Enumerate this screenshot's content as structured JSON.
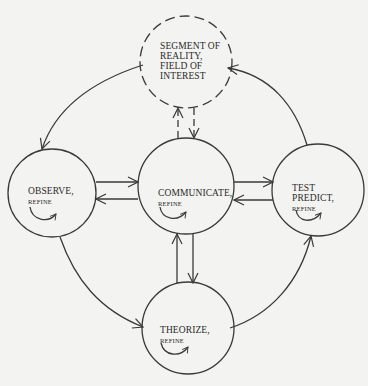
{
  "diagram": {
    "title": "",
    "stroke_color": "#3a3a3a",
    "background": "#f3f3f1",
    "nodes": [
      {
        "id": "segment",
        "lines": [
          "SEGMENT OF",
          "REALITY,",
          "FIELD OF",
          "INTEREST"
        ],
        "sub": "",
        "style": "dashed",
        "center": [
          186,
          62
        ],
        "radius": 46
      },
      {
        "id": "observe",
        "lines": [
          "OBSERVE,"
        ],
        "sub": "REFINE",
        "style": "solid",
        "has_refine_loop": true,
        "center": [
          52,
          193
        ],
        "radius": 44
      },
      {
        "id": "communicate",
        "lines": [
          "COMMUNICATE,"
        ],
        "sub": "REFINE",
        "style": "solid",
        "has_refine_loop": true,
        "center": [
          186,
          186
        ],
        "radius": 48
      },
      {
        "id": "test",
        "lines": [
          "TEST",
          "PREDICT,"
        ],
        "sub": "REFINE",
        "style": "solid",
        "has_refine_loop": true,
        "center": [
          318,
          190
        ],
        "radius": 46
      },
      {
        "id": "theorize",
        "lines": [
          "THEORIZE,"
        ],
        "sub": "REFINE",
        "style": "solid",
        "has_refine_loop": true,
        "center": [
          188,
          328
        ],
        "radius": 46
      }
    ],
    "edges": [
      {
        "from": "segment",
        "to": "observe",
        "type": "curved",
        "style": "solid"
      },
      {
        "from": "observe",
        "to": "theorize",
        "type": "curved",
        "style": "solid"
      },
      {
        "from": "theorize",
        "to": "test",
        "type": "curved",
        "style": "solid"
      },
      {
        "from": "test",
        "to": "segment",
        "type": "curved",
        "style": "solid"
      },
      {
        "from": "observe",
        "to": "communicate",
        "type": "double-line",
        "style": "solid"
      },
      {
        "from": "communicate",
        "to": "observe",
        "type": "double-line",
        "style": "solid"
      },
      {
        "from": "communicate",
        "to": "test",
        "type": "double-line",
        "style": "solid"
      },
      {
        "from": "test",
        "to": "communicate",
        "type": "double-line",
        "style": "solid"
      },
      {
        "from": "communicate",
        "to": "segment",
        "type": "double-line",
        "style": "dashed"
      },
      {
        "from": "segment",
        "to": "communicate",
        "type": "double-line",
        "style": "dashed"
      },
      {
        "from": "theorize",
        "to": "communicate",
        "type": "double-line",
        "style": "solid"
      },
      {
        "from": "communicate",
        "to": "theorize",
        "type": "double-line",
        "style": "solid"
      }
    ]
  }
}
